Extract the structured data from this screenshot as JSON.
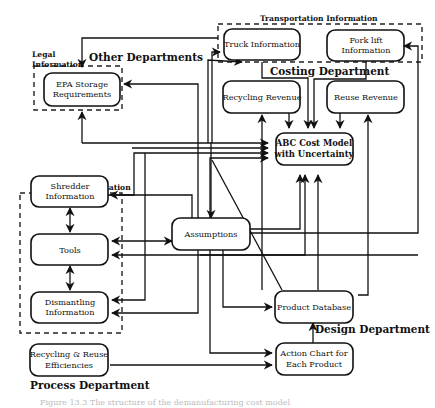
{
  "diagram": {
    "groups": {
      "legal": "Legal\nInformation",
      "transportation": "Transportation Information",
      "equipment": "Equipment Information"
    },
    "departments": {
      "other": "Other Departments",
      "costing": "Costing Department",
      "design": "Design Department",
      "process": "Process Department"
    },
    "nodes": {
      "epa": [
        "EPA Storage",
        "Requirements"
      ],
      "truck": [
        "Truck Information"
      ],
      "forklift": [
        "Fork lift",
        "Information"
      ],
      "recycling_revenue": [
        "Recycling Revenue"
      ],
      "reuse_revenue": [
        "Reuse Revenue"
      ],
      "abc": [
        "ABC Cost Model",
        "with Uncertainty"
      ],
      "shredder": [
        "Shredder",
        "Information"
      ],
      "tools": [
        "Tools"
      ],
      "dismantling": [
        "Dismantling",
        "Information"
      ],
      "assumptions": [
        "Assumptions"
      ],
      "product_db": [
        "Product Database"
      ],
      "action_chart": [
        "Action Chart for",
        "Each Product"
      ],
      "efficiencies": [
        "Recycling & Reuse",
        "Efficiencies"
      ]
    },
    "edges": [
      {
        "from": "truck",
        "to": "abc"
      },
      {
        "from": "forklift",
        "to": "abc"
      },
      {
        "from": "recycling_revenue",
        "to": "abc"
      },
      {
        "from": "reuse_revenue",
        "to": "abc"
      },
      {
        "from": "abc",
        "to": "truck"
      },
      {
        "from": "abc",
        "to": "epa"
      },
      {
        "from": "abc",
        "to": "shredder"
      },
      {
        "from": "abc",
        "to": "tools"
      },
      {
        "from": "abc",
        "to": "dismantling"
      },
      {
        "from": "assumptions",
        "to": "abc"
      },
      {
        "from": "assumptions",
        "to": "truck"
      },
      {
        "from": "assumptions",
        "to": "tools"
      },
      {
        "from": "assumptions",
        "to": "product_db"
      },
      {
        "from": "assumptions",
        "to": "action_chart"
      },
      {
        "from": "assumptions",
        "to": "forklift"
      },
      {
        "from": "shredder",
        "to": "abc"
      },
      {
        "from": "shredder",
        "to": "tools"
      },
      {
        "from": "tools",
        "to": "dismantling"
      },
      {
        "from": "tools",
        "to": "assumptions"
      },
      {
        "from": "product_db",
        "to": "abc"
      },
      {
        "from": "product_db",
        "to": "truck"
      },
      {
        "from": "product_db",
        "to": "recycling_revenue"
      },
      {
        "from": "product_db",
        "to": "reuse_revenue"
      },
      {
        "from": "action_chart",
        "to": "product_db"
      },
      {
        "from": "efficiencies",
        "to": "action_chart"
      }
    ],
    "caption": "Figure 13.3  The structure of the demanufacturing cost model"
  }
}
